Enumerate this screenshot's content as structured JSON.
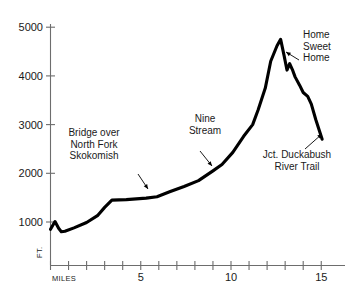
{
  "chart_data": {
    "type": "line",
    "title": "",
    "xlabel": "MILES",
    "ylabel": "FT.",
    "xlim": [
      0,
      15.6
    ],
    "ylim": [
      400,
      5200
    ],
    "grid": false,
    "legend": null,
    "x_ticks_major": [
      5,
      10,
      15
    ],
    "x_tick_labels": [
      "5",
      "10",
      "15"
    ],
    "x_ticks_minor": [
      0,
      1,
      2,
      3,
      4,
      5,
      6,
      7,
      8,
      9,
      10,
      11,
      12,
      13,
      14,
      15
    ],
    "y_ticks": [
      1000,
      2000,
      3000,
      4000,
      5000
    ],
    "y_tick_labels": [
      "1000",
      "2000",
      "3000",
      "4000",
      "5000"
    ],
    "series": [
      {
        "name": "Elevation profile",
        "x": [
          0.0,
          0.25,
          0.45,
          0.6,
          0.8,
          1.3,
          2.0,
          2.6,
          3.0,
          3.4,
          4.2,
          5.3,
          5.9,
          6.6,
          7.4,
          8.2,
          9.0,
          9.5,
          10.1,
          10.7,
          11.2,
          11.5,
          11.9,
          12.2,
          12.55,
          12.75,
          12.95,
          13.1,
          13.25,
          13.4,
          13.55,
          13.8,
          14.0,
          14.25,
          14.45,
          14.7,
          15.05
        ],
        "y": [
          850,
          1010,
          870,
          800,
          810,
          880,
          990,
          1130,
          1300,
          1450,
          1460,
          1490,
          1520,
          1620,
          1730,
          1850,
          2050,
          2180,
          2430,
          2760,
          3000,
          3300,
          3750,
          4300,
          4620,
          4750,
          4400,
          4120,
          4250,
          4130,
          3980,
          3810,
          3660,
          3580,
          3420,
          3100,
          2700
        ]
      }
    ],
    "annotations": [
      {
        "id": "bridge",
        "lines": [
          "Bridge over",
          "North Fork",
          "Skokomish"
        ],
        "text_x": 94,
        "text_y": 136,
        "align": "middle",
        "arrow_from": [
          138,
          174
        ],
        "arrow_to": [
          148,
          189
        ]
      },
      {
        "id": "nine-stream",
        "lines": [
          "Nine",
          "Stream"
        ],
        "text_x": 205,
        "text_y": 122,
        "align": "middle",
        "arrow_from": [
          200,
          151
        ],
        "arrow_to": [
          212,
          166
        ]
      },
      {
        "id": "home-sweet-home",
        "lines": [
          "Home",
          "Sweet",
          "Home"
        ],
        "text_x": 303,
        "text_y": 38,
        "align": "start",
        "arrow_from": [
          299,
          60
        ],
        "arrow_to": [
          286,
          52
        ]
      },
      {
        "id": "jct-duckabush",
        "lines": [
          "Jct. Duckabush",
          "River Trail"
        ],
        "text_x": 297,
        "text_y": 158,
        "align": "middle",
        "arrow_from": [
          305,
          149
        ],
        "arrow_to": [
          322,
          134
        ]
      }
    ]
  },
  "axes": {
    "y_axis_caption": "FT.",
    "x_axis_caption": "MILES"
  },
  "colors": {
    "line": "#000000",
    "axis": "#6d6d6d",
    "text": "#1a1a1a",
    "background": "#ffffff"
  }
}
